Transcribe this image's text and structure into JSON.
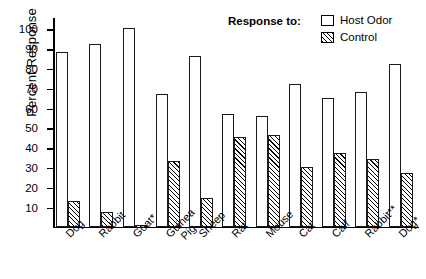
{
  "chart_data": {
    "type": "bar",
    "title": "",
    "xlabel": "",
    "ylabel": "Percent Response",
    "ylim": [
      0,
      105
    ],
    "yticks": [
      10,
      20,
      30,
      40,
      50,
      60,
      70,
      80,
      90,
      100
    ],
    "grid": false,
    "legend_position": "top-right",
    "legend_title": "Response to:",
    "categories": [
      "Dog",
      "Rabbit",
      "Goat*",
      "Guinea Pig",
      "Sheep",
      "Rat",
      "Mouse",
      "Cat",
      "Calf",
      "Rabbit**",
      "Dog*"
    ],
    "series": [
      {
        "name": "Host Odor",
        "fill": "open",
        "values": [
          88,
          92,
          100,
          67,
          86,
          57,
          56,
          72,
          65,
          68,
          82
        ]
      },
      {
        "name": "Control",
        "fill": "hatched",
        "values": [
          13,
          7.5,
          0,
          33,
          14.5,
          45,
          46,
          30,
          37,
          34,
          27
        ]
      }
    ]
  },
  "axis": {
    "y_title": "Percent Response",
    "tick_labels": [
      "100",
      "90",
      "80",
      "70",
      "60",
      "50",
      "40",
      "30",
      "20",
      "10"
    ],
    "category_labels": [
      {
        "line1": "Dog",
        "line2": ""
      },
      {
        "line1": "Rabbit",
        "line2": ""
      },
      {
        "line1": "Goat*",
        "line2": ""
      },
      {
        "line1": "Guinea",
        "line2": "Pig"
      },
      {
        "line1": "Sheep",
        "line2": ""
      },
      {
        "line1": "Rat",
        "line2": ""
      },
      {
        "line1": "Mouse",
        "line2": ""
      },
      {
        "line1": "Cat",
        "line2": ""
      },
      {
        "line1": "Calf",
        "line2": ""
      },
      {
        "line1": "Rabbit**",
        "line2": ""
      },
      {
        "line1": "Dog*",
        "line2": ""
      }
    ]
  },
  "legend": {
    "title": "Response to:",
    "entries": [
      {
        "label": "Host Odor",
        "style": "open-box"
      },
      {
        "label": "Control",
        "style": "hatched-box"
      }
    ]
  },
  "colors": {
    "ink": "#000000",
    "background": "#ffffff",
    "bar_outline": "#1a1a1a"
  }
}
